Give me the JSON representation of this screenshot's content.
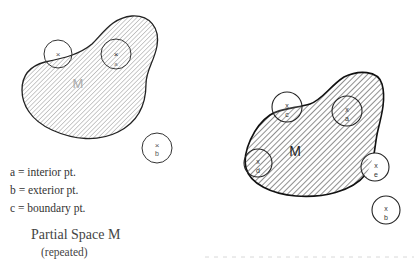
{
  "legend": {
    "items": [
      {
        "key": "a",
        "label": "a = interior pt."
      },
      {
        "key": "b",
        "label": "b = exterior pt."
      },
      {
        "key": "c",
        "label": "c = boundary pt."
      }
    ]
  },
  "caption": {
    "title": "Partial Space M",
    "subtitle": "(repeated)"
  },
  "left_figure": {
    "space_label": "M",
    "points": [
      {
        "mark": "×",
        "label": "c",
        "type": "boundary"
      },
      {
        "mark": "×",
        "label": "a",
        "type": "interior"
      },
      {
        "mark": "×",
        "label": "b",
        "type": "exterior"
      }
    ]
  },
  "right_figure": {
    "space_label": "M",
    "points": [
      {
        "mark": "x",
        "label": "c",
        "type": "boundary"
      },
      {
        "mark": "x",
        "label": "a",
        "type": "interior"
      },
      {
        "mark": "x",
        "label": "d",
        "type": "boundary"
      },
      {
        "mark": "x",
        "label": "e",
        "type": "boundary"
      },
      {
        "mark": "x",
        "label": "b",
        "type": "exterior"
      }
    ]
  },
  "colors": {
    "stroke": "#222222",
    "hatch": "#555555",
    "text": "#333333"
  }
}
